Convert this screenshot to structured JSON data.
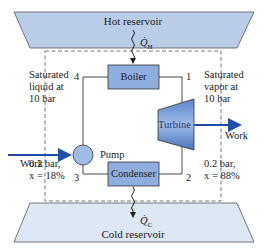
{
  "hot_reservoir": {
    "label": "Hot reservoir",
    "heat": "Q̇",
    "heat_sub": "H"
  },
  "cold_reservoir": {
    "label": "Cold reservoir",
    "heat": "Q̇",
    "heat_sub": "C"
  },
  "components": {
    "boiler": "Boiler",
    "condenser": "Condenser",
    "pump": "Pump",
    "turbine": "Turbine"
  },
  "states": {
    "s1": "1",
    "s2": "2",
    "s3": "3",
    "s4": "4"
  },
  "annotations": {
    "left_top": [
      "Saturated",
      "liquid at",
      "10 bar"
    ],
    "right_top": [
      "Saturated",
      "vapor at",
      "10 bar"
    ],
    "left_bottom": [
      "0.2 bar,",
      "x = 18%"
    ],
    "right_bottom": [
      "0.2 bar,",
      "x = 88%"
    ],
    "work_in": "Work",
    "work_out": "Work"
  },
  "colors": {
    "reservoir_fill": "#b9cde8",
    "reservoir_fill_cold": "#dde8f4",
    "component_fill": "#8eaee0",
    "arrow_blue": "#1f4fa8",
    "line": "#333333"
  }
}
